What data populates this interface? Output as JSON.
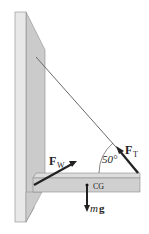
{
  "figure": {
    "labels": {
      "wall_force": "F",
      "wall_force_sub": "W",
      "tension_force": "F",
      "tension_force_sub": "T",
      "angle": "50°",
      "center_of_gravity": "CG",
      "weight_m": "m",
      "weight_g": "g"
    },
    "colors": {
      "wall_front": "#e6e6e6",
      "wall_side": "#c8c8c8",
      "beam_top": "#d9d9d9",
      "beam_front": "#cfcfcf",
      "cable": "#666666",
      "arrow": "#333333"
    }
  }
}
